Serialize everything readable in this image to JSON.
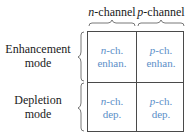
{
  "columns": [
    {
      "prefix": "n",
      "suffix": "-channel"
    },
    {
      "prefix": "p",
      "suffix": "-channel"
    }
  ],
  "rows": [
    {
      "line1": "Enhancement",
      "line2": "mode"
    },
    {
      "line1": "Depletion",
      "line2": "mode"
    }
  ],
  "cells": {
    "n_enh": {
      "prefix": "n",
      "suffix": "-ch.",
      "line2": "enhan."
    },
    "p_enh": {
      "prefix": "p",
      "suffix": "-ch.",
      "line2": "enhan."
    },
    "n_dep": {
      "prefix": "n",
      "suffix": "-ch.",
      "line2": "dep."
    },
    "p_dep": {
      "prefix": "p",
      "suffix": "-ch.",
      "line2": "dep."
    }
  },
  "colors": {
    "cell_text": "#5b8fc8",
    "label_text": "#1a1a1a",
    "grid_line": "#4a4a4a"
  }
}
